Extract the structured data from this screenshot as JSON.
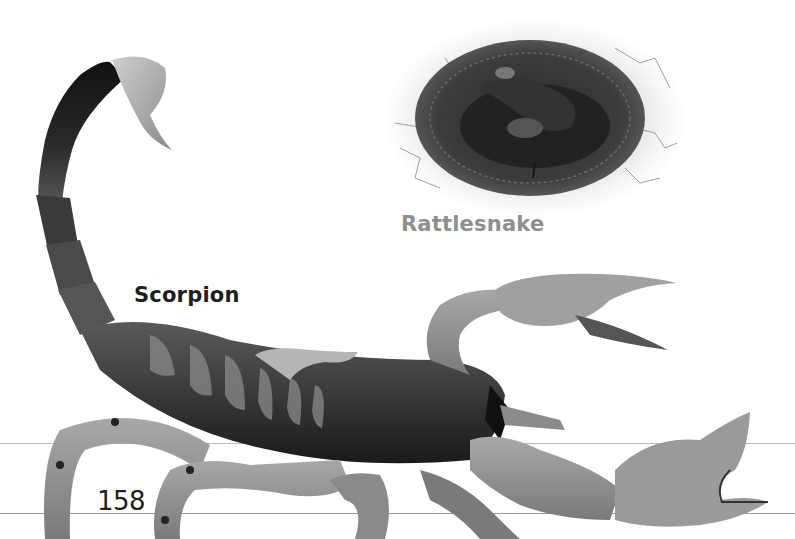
{
  "page": {
    "page_number": "158",
    "labels": {
      "scorpion": "Scorpion",
      "rattlesnake": "Rattlesnake"
    },
    "images": [
      {
        "name": "scorpion-photo",
        "description": "Scorpion with raised tail and open pincers"
      },
      {
        "name": "rattlesnake-photo",
        "description": "Coiled rattlesnake on cracked dry ground"
      }
    ],
    "colors": {
      "scorpion_label": "#1e1e1e",
      "rattlesnake_label": "#8f8f8f",
      "page_number": "#222222",
      "background": "#ffffff"
    }
  }
}
